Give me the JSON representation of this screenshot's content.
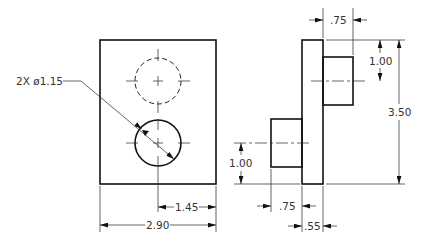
{
  "drawing": {
    "type": "orthographic engineering drawing",
    "views": [
      "front",
      "right-side"
    ],
    "front_view": {
      "hole_callout": "2X ø1.15",
      "dimensions": {
        "hole_center_from_edge": "1.45",
        "overall_width": "2.90"
      }
    },
    "side_view": {
      "dimensions": {
        "top_boss_length": ".75",
        "top_boss_center_from_top": "1.00",
        "overall_height": "3.50",
        "bottom_boss_center_from_bottom": "1.00",
        "bottom_boss_length": ".75",
        "plate_thickness": ".55"
      }
    }
  }
}
